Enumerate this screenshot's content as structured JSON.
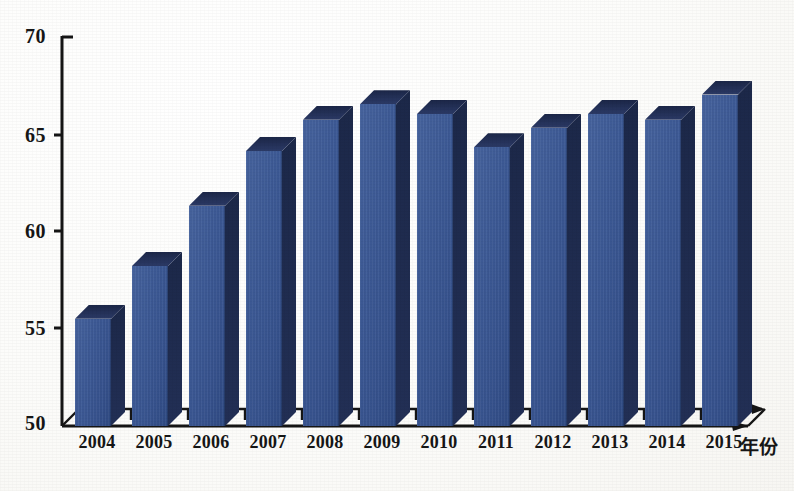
{
  "chart_data": {
    "type": "bar",
    "title": "",
    "subtitle": "",
    "xlabel": "年份",
    "ylabel": "",
    "categories": [
      "2004",
      "2005",
      "2006",
      "2007",
      "2008",
      "2009",
      "2010",
      "2011",
      "2012",
      "2013",
      "2014",
      "2015"
    ],
    "values": [
      55.5,
      58.2,
      61.3,
      64.1,
      65.7,
      66.5,
      66.0,
      64.3,
      65.3,
      66.0,
      65.7,
      67.0
    ],
    "series": [
      {
        "name": "",
        "values": [
          55.5,
          58.2,
          61.3,
          64.1,
          65.7,
          66.5,
          66.0,
          64.3,
          65.3,
          66.0,
          65.7,
          67.0
        ]
      }
    ],
    "ylim": [
      50,
      70
    ],
    "yticks": [
      "70",
      "65",
      "60",
      "55",
      "50"
    ],
    "ytick_values": [
      70,
      65,
      60,
      55,
      50
    ],
    "grid": false,
    "legend": false,
    "legend_position": "none",
    "annotations": [],
    "style": "3d-column",
    "colors": {
      "bar_front": "#3d5a96",
      "bar_top": "#222f55",
      "bar_side": "#1f2c50",
      "axis": "#151515",
      "text": "#161616",
      "background": "#fdfdfb"
    }
  },
  "axis": {
    "y_ticks": [
      {
        "label": "70",
        "value": 70
      },
      {
        "label": "65",
        "value": 65
      },
      {
        "label": "60",
        "value": 60
      },
      {
        "label": "55",
        "value": 55
      },
      {
        "label": "50",
        "value": 50
      }
    ],
    "x_ticks": [
      {
        "label": "2004"
      },
      {
        "label": "2005"
      },
      {
        "label": "2006"
      },
      {
        "label": "2007"
      },
      {
        "label": "2008"
      },
      {
        "label": "2009"
      },
      {
        "label": "2010"
      },
      {
        "label": "2011"
      },
      {
        "label": "2012"
      },
      {
        "label": "2013"
      },
      {
        "label": "2014"
      },
      {
        "label": "2015"
      }
    ],
    "x_caption": "年份"
  }
}
